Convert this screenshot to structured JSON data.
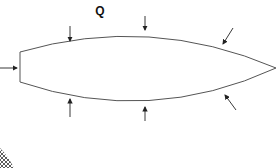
{
  "diagram": {
    "label": "Q",
    "colors": {
      "outline": "#555555",
      "arrow": "#222222",
      "label": "#111111",
      "hatch": "#333333",
      "background": "#ffffff"
    },
    "body": {
      "shape": "lens / airfoil with blunt left edge and pointed right tip",
      "blunt_edge": {
        "x": 20,
        "y_top": 52,
        "y_bottom": 82
      },
      "tip": {
        "x": 276,
        "y": 68
      }
    },
    "arrows": [
      {
        "id": "left",
        "from": [
          0,
          68
        ],
        "to": [
          18,
          68
        ]
      },
      {
        "id": "top-left",
        "from": [
          70,
          26
        ],
        "to": [
          70,
          42
        ]
      },
      {
        "id": "top-center",
        "from": [
          145,
          16
        ],
        "to": [
          145,
          31
        ]
      },
      {
        "id": "top-right",
        "from": [
          233,
          28
        ],
        "to": [
          222,
          45
        ]
      },
      {
        "id": "bottom-left",
        "from": [
          70,
          117
        ],
        "to": [
          70,
          98
        ]
      },
      {
        "id": "bottom-center",
        "from": [
          145,
          121
        ],
        "to": [
          145,
          106
        ]
      },
      {
        "id": "bottom-right",
        "from": [
          236,
          110
        ],
        "to": [
          224,
          94
        ]
      }
    ]
  }
}
